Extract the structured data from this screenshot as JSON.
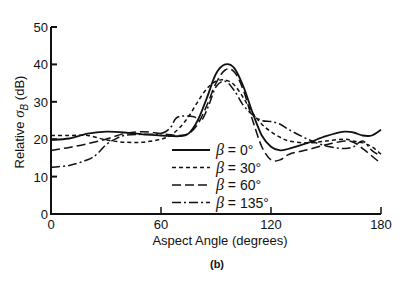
{
  "chart_data": {
    "type": "line",
    "title": "",
    "caption": "(b)",
    "xlabel": "Aspect Angle (degrees)",
    "ylabel_prefix": "Relative ",
    "ylabel_symbol": "σ",
    "ylabel_subscript": "B",
    "ylabel_suffix": " (dB)",
    "xlim": [
      0,
      180
    ],
    "ylim": [
      0,
      50
    ],
    "xticks": [
      0,
      60,
      120,
      180
    ],
    "yticks": [
      0,
      10,
      20,
      30,
      40,
      50
    ],
    "xtick_labels": [
      "0",
      "60",
      "120",
      "180"
    ],
    "ytick_labels": [
      "0",
      "10",
      "20",
      "30",
      "40",
      "50"
    ],
    "grid": false,
    "legend_position": "center-right",
    "series": [
      {
        "name": "β = 0°",
        "dash": "solid",
        "x": [
          0,
          10,
          20,
          30,
          40,
          50,
          60,
          70,
          75,
          80,
          85,
          90,
          95,
          100,
          105,
          110,
          115,
          120,
          125,
          130,
          140,
          150,
          160,
          165,
          170,
          175,
          180
        ],
        "y": [
          19.8,
          20.2,
          21.5,
          22,
          21.8,
          21.3,
          21,
          20.8,
          21.5,
          25,
          31,
          37.5,
          40,
          39,
          34,
          27,
          21,
          18,
          17,
          17.5,
          19,
          20.8,
          22,
          21.8,
          21,
          21,
          22.5
        ]
      },
      {
        "name": "β = 30°",
        "dash": "4,3",
        "x": [
          0,
          10,
          20,
          30,
          40,
          50,
          60,
          65,
          70,
          75,
          80,
          85,
          90,
          95,
          100,
          105,
          110,
          115,
          120,
          125,
          130,
          140,
          150,
          160,
          165,
          170,
          175,
          180
        ],
        "y": [
          21,
          21,
          21,
          19.8,
          19.2,
          19.2,
          20,
          21,
          23,
          26,
          30,
          33.5,
          35.5,
          35.8,
          34.5,
          31,
          27,
          24,
          22,
          20.5,
          19.5,
          19,
          19.5,
          20,
          19.5,
          19,
          18,
          16
        ]
      },
      {
        "name": "β = 60°",
        "dash": "9,4",
        "x": [
          0,
          10,
          20,
          30,
          40,
          50,
          60,
          70,
          75,
          80,
          85,
          90,
          95,
          100,
          105,
          110,
          115,
          120,
          125,
          130,
          140,
          150,
          160,
          165,
          170,
          175,
          180
        ],
        "y": [
          17,
          17.8,
          18.8,
          20,
          21.5,
          22,
          21.5,
          21,
          21.5,
          24,
          29,
          35,
          38.5,
          38,
          33,
          25,
          18,
          14.5,
          14.5,
          16,
          17.2,
          18.5,
          19.5,
          19.2,
          17.5,
          15.5,
          13.5
        ]
      },
      {
        "name": "β = 135°",
        "dash": "9,3,2,3",
        "x": [
          0,
          10,
          20,
          25,
          30,
          35,
          40,
          50,
          60,
          65,
          68,
          72,
          78,
          82,
          86,
          90,
          95,
          100,
          105,
          110,
          115,
          120,
          125,
          130,
          140,
          150,
          160,
          165,
          170,
          175,
          178
        ],
        "y": [
          12.5,
          13,
          14.5,
          16,
          18.5,
          20,
          21,
          21.3,
          21.5,
          23,
          25.5,
          26.2,
          26,
          25,
          29,
          34,
          35.5,
          33,
          29,
          26.5,
          25,
          24.7,
          24,
          22.5,
          20,
          18.2,
          17.5,
          18,
          19.5,
          17,
          16
        ]
      }
    ]
  }
}
